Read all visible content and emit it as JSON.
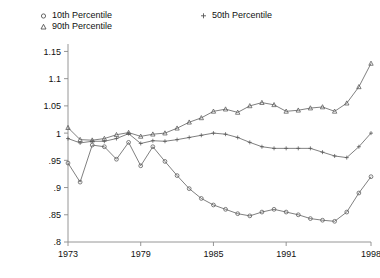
{
  "chart_data": {
    "type": "line",
    "title": "",
    "subtitle": "",
    "xlabel": "",
    "ylabel": "",
    "xlim": [
      1973,
      1998
    ],
    "ylim": [
      0.8,
      1.16
    ],
    "grid": false,
    "legend_position": "top",
    "x": [
      1973,
      1974,
      1975,
      1976,
      1977,
      1978,
      1979,
      1980,
      1981,
      1982,
      1983,
      1984,
      1985,
      1986,
      1987,
      1988,
      1989,
      1990,
      1991,
      1992,
      1993,
      1994,
      1995,
      1996,
      1997,
      1998
    ],
    "xticks": [
      1973,
      1979,
      1985,
      1991,
      1998
    ],
    "xtick_labels": [
      "1973",
      "1979",
      "1985",
      "1991",
      "1998"
    ],
    "yticks": [
      0.8,
      0.85,
      0.9,
      0.95,
      1.0,
      1.05,
      1.1,
      1.15
    ],
    "ytick_labels": [
      ".8",
      ".85",
      ".9",
      ".95",
      "1",
      "1.05",
      "1.1",
      "1.15"
    ],
    "series": [
      {
        "name": "10th Percentile",
        "marker": "circle",
        "color": "#555555",
        "values": [
          0.945,
          0.91,
          0.978,
          0.975,
          0.952,
          0.983,
          0.94,
          0.975,
          0.948,
          0.922,
          0.898,
          0.88,
          0.868,
          0.86,
          0.852,
          0.848,
          0.855,
          0.86,
          0.855,
          0.85,
          0.843,
          0.84,
          0.838,
          0.855,
          0.89,
          0.92
        ]
      },
      {
        "name": "50th Percentile",
        "marker": "plus",
        "color": "#555555",
        "values": [
          0.99,
          0.982,
          0.985,
          0.985,
          0.99,
          0.999,
          0.981,
          0.986,
          0.985,
          0.988,
          0.992,
          0.996,
          1.0,
          0.998,
          0.992,
          0.983,
          0.975,
          0.972,
          0.972,
          0.972,
          0.972,
          0.965,
          0.958,
          0.955,
          0.975,
          1.0
        ]
      },
      {
        "name": "90th Percentile",
        "marker": "triangle",
        "color": "#555555",
        "values": [
          1.01,
          0.988,
          0.987,
          0.99,
          0.997,
          1.001,
          0.994,
          0.998,
          1.0,
          1.009,
          1.02,
          1.028,
          1.04,
          1.044,
          1.038,
          1.05,
          1.056,
          1.052,
          1.04,
          1.042,
          1.046,
          1.048,
          1.04,
          1.055,
          1.085,
          1.128
        ]
      }
    ]
  },
  "legend": {
    "entries": [
      {
        "label": "10th Percentile",
        "marker": "circle-marker-icon"
      },
      {
        "label": "90th Percentile",
        "marker": "triangle-marker-icon"
      },
      {
        "label": "50th Percentile",
        "marker": "plus-marker-icon"
      }
    ]
  },
  "colors": {
    "axis": "#8a8a8a",
    "line": "#555555",
    "text": "#111111",
    "background": "#ffffff"
  }
}
